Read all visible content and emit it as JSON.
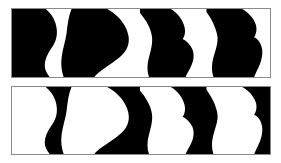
{
  "figure": {
    "panel_count": 2,
    "colors": {
      "ink": "#000000",
      "paper": "#ffffff",
      "frame": "#8a8a8a",
      "page_background": "#ffffff"
    },
    "canvas": {
      "width": 281,
      "height": 163
    },
    "panels": [
      {
        "id": "panel-top",
        "name": "upper-panel",
        "polarity": "figures-black-on-white",
        "ink_color": "#000000",
        "paper_color": "#ffffff",
        "frame_color": "#8a8a8a",
        "x": 11,
        "y": 8,
        "width": 260,
        "height": 70,
        "figure_count": 4,
        "figure_labels": [
          "left-edge-half-profile",
          "rounded-head-profile",
          "notched-nose-profile",
          "right-tall-profile"
        ],
        "negative_space_label": "goblet-vase-silhouette",
        "negative_space_count": 4
      },
      {
        "id": "panel-bottom",
        "name": "lower-panel",
        "polarity": "figures-white-on-black",
        "ink_color": "#000000",
        "paper_color": "#ffffff",
        "frame_color": "#8a8a8a",
        "x": 11,
        "y": 86,
        "width": 260,
        "height": 69,
        "figure_count": 4,
        "figure_labels": [
          "left-edge-half-profile",
          "rounded-head-profile",
          "notched-nose-profile",
          "right-tall-profile"
        ],
        "negative_space_label": "goblet-vase-silhouette",
        "negative_space_count": 4
      }
    ],
    "shape_paths": {
      "viewbox": "0 0 260 70",
      "left_edge_profile": "M0,0 L34,0 C40,5 44,12 45,20 C46,28 44,34 40,40 C36,46 33,52 33,58 C33,63 35,66 38,70 L0,70 Z",
      "rounded_head_profile": "M60,0 L96,0 C103,4 110,10 114,18 C118,26 119,33 116,40 C113,47 106,52 99,57 C92,62 86,66 83,70 L52,70 C50,64 49,57 50,50 C51,41 54,33 55,25 C56,16 57,7 60,0 Z",
      "notched_nose_profile": "M129,0 L160,0 C167,4 172,11 174,19 C175,24 174,28 172,31 C176,33 180,37 182,42 C184,48 183,54 180,60 C178,64 176,67 175,70 L138,70 C136,64 136,57 138,50 C140,42 142,35 141,28 C140,20 135,11 129,4 Z",
      "right_tall_profile": "M196,0 L232,0 C239,4 244,10 246,17 C247,22 246,26 244,29 C248,31 251,35 252,41 C253,48 251,55 248,61 C246,65 245,68 244,70 L203,70 C201,64 201,57 203,50 C205,42 208,35 207,28 C206,20 201,10 196,3 Z"
    }
  }
}
